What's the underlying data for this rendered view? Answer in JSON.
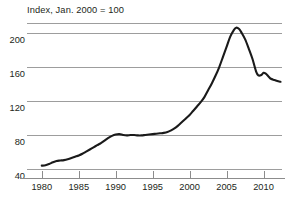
{
  "chart_data": {
    "type": "line",
    "title": "Index, Jan. 2000 = 100",
    "xlabel": "",
    "ylabel": "",
    "xlim": [
      1978.0,
      2012.5
    ],
    "ylim": [
      30,
      212
    ],
    "grid": true,
    "legend": false,
    "yticks": [
      200,
      160,
      120,
      80,
      40
    ],
    "ytick_labels": [
      "200",
      "160",
      "120",
      "80",
      "40"
    ],
    "xticks": [
      1980,
      1985,
      1990,
      1995,
      2000,
      2005,
      2010
    ],
    "xtick_labels": [
      "1980",
      "1985",
      "1990",
      "1995",
      "2000",
      "2005",
      "2010"
    ],
    "series": [
      {
        "name": "Index",
        "color": "#1a1a1a",
        "x": [
          1980.0,
          1980.5,
          1981.0,
          1981.5,
          1982.0,
          1982.5,
          1983.0,
          1983.5,
          1984.0,
          1984.5,
          1985.0,
          1985.5,
          1986.0,
          1986.5,
          1987.0,
          1987.5,
          1988.0,
          1988.5,
          1989.0,
          1989.5,
          1990.0,
          1990.5,
          1991.0,
          1991.5,
          1992.0,
          1992.5,
          1993.0,
          1993.5,
          1994.0,
          1994.5,
          1995.0,
          1995.5,
          1996.0,
          1996.5,
          1997.0,
          1997.5,
          1998.0,
          1998.5,
          1999.0,
          1999.5,
          2000.0,
          2000.5,
          2001.0,
          2001.5,
          2002.0,
          2002.5,
          2003.0,
          2003.5,
          2004.0,
          2004.5,
          2005.0,
          2005.5,
          2006.0,
          2006.3,
          2006.7,
          2007.0,
          2007.5,
          2008.0,
          2008.5,
          2009.0,
          2009.3,
          2009.7,
          2010.0,
          2010.3,
          2010.7,
          2011.0,
          2011.5,
          2012.0,
          2012.3
        ],
        "y": [
          44.5,
          45.0,
          46.5,
          48.5,
          50.0,
          50.5,
          51.0,
          52.0,
          53.5,
          55.0,
          56.5,
          58.5,
          61.0,
          63.5,
          66.0,
          68.5,
          71.0,
          74.0,
          77.0,
          79.5,
          81.0,
          81.5,
          80.5,
          80.0,
          80.5,
          80.5,
          80.0,
          80.0,
          80.5,
          81.0,
          81.5,
          82.0,
          82.5,
          83.0,
          84.0,
          86.0,
          88.5,
          92.0,
          96.0,
          100.0,
          104.0,
          109.0,
          114.0,
          119.0,
          125.0,
          133.0,
          141.0,
          150.0,
          160.0,
          172.0,
          184.0,
          196.0,
          204.0,
          206.5,
          205.0,
          201.0,
          193.0,
          182.0,
          170.0,
          155.0,
          150.5,
          151.0,
          153.5,
          152.5,
          149.0,
          146.5,
          145.0,
          143.5,
          143.0
        ]
      }
    ]
  },
  "axis": {
    "ytick_labels": [
      "200",
      "160",
      "120",
      "80",
      "40"
    ],
    "xtick_labels": [
      "1980",
      "1985",
      "1990",
      "1995",
      "2000",
      "2005",
      "2010"
    ]
  },
  "style": {
    "line_color": "#1a1a1a",
    "grid_color": "#9d9d9d",
    "axis_color": "#8c8c8c",
    "text_color": "#231f20",
    "background": "#ffffff"
  }
}
